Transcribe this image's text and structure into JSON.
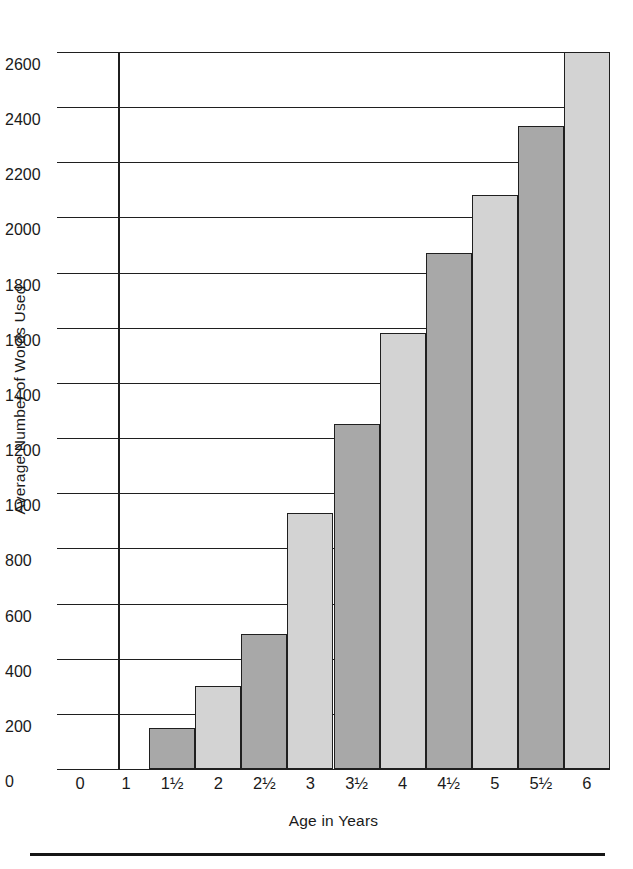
{
  "chart_data": {
    "type": "bar",
    "title": "",
    "xlabel": "Age in Years",
    "ylabel": "Average Number of Words Used",
    "categories": [
      "1½",
      "2",
      "2½",
      "3",
      "3½",
      "4",
      "4½",
      "5",
      "5½",
      "6"
    ],
    "values": [
      150,
      300,
      490,
      930,
      1250,
      1580,
      1870,
      2080,
      2330,
      2600
    ],
    "bar_shades": [
      "dark",
      "light",
      "dark",
      "light",
      "dark",
      "light",
      "dark",
      "light",
      "dark",
      "light"
    ],
    "x_tick_labels": [
      "0",
      "1",
      "1½",
      "2",
      "2½",
      "3",
      "3½",
      "4",
      "4½",
      "5",
      "5½",
      "6"
    ],
    "y_tick_labels": [
      "0",
      "200",
      "400",
      "600",
      "800",
      "1000",
      "1200",
      "1400",
      "1600",
      "1800",
      "2000",
      "2200",
      "2400",
      "2600"
    ],
    "y_tick_values": [
      0,
      200,
      400,
      600,
      800,
      1000,
      1200,
      1400,
      1600,
      1800,
      2000,
      2200,
      2400,
      2600
    ],
    "ylim": [
      0,
      2600
    ],
    "grid": "horizontal",
    "legend": "none",
    "colors": {
      "bar_dark": "#a8a8a8",
      "bar_light": "#d3d3d3",
      "bar_edge": "#1f1f1f",
      "gridline": "#1f1f1f",
      "axis": "#1f1f1f",
      "text": "#1a1a1a",
      "background": "#ffffff"
    }
  }
}
